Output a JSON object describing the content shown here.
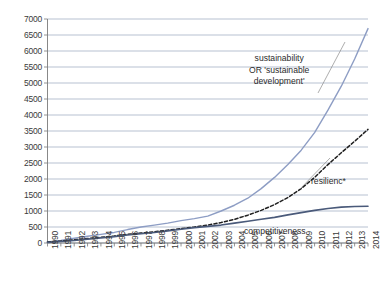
{
  "chart_data": {
    "type": "line",
    "title": "",
    "subtitle": "",
    "xlabel": "",
    "ylabel": "",
    "xlim": [
      1990,
      2014
    ],
    "ylim": [
      0,
      7000
    ],
    "ytick_step": 500,
    "grid": "horizontal",
    "legend": "none (inline annotations)",
    "x": [
      1990,
      1991,
      1992,
      1993,
      1994,
      1995,
      1996,
      1997,
      1998,
      1999,
      2000,
      2001,
      2002,
      2003,
      2004,
      2005,
      2006,
      2007,
      2008,
      2009,
      2010,
      2011,
      2012,
      2013,
      2014
    ],
    "yticks": [
      0,
      500,
      1000,
      1500,
      2000,
      2500,
      3000,
      3500,
      4000,
      4500,
      5000,
      5500,
      6000,
      6500,
      7000
    ],
    "ytick_labels": [
      "0",
      "500",
      "1000",
      "1500",
      "2000",
      "2500",
      "3000",
      "3500",
      "4000",
      "4500",
      "5000",
      "5500",
      "6000",
      "6500",
      "7000"
    ],
    "xtick_labels": [
      "1990",
      "1991",
      "1992",
      "1993",
      "1994",
      "1995",
      "1996",
      "1997",
      "1998",
      "1999",
      "2000",
      "2001",
      "2002",
      "2003",
      "2004",
      "2005",
      "2006",
      "2007",
      "2008",
      "2009",
      "2010",
      "2011",
      "2012",
      "2013",
      "2014"
    ],
    "series": [
      {
        "name": "sustainability OR 'sustainable development'",
        "style": "solid",
        "color": "#8D9DC4",
        "width": 1.4,
        "values": [
          30,
          80,
          150,
          210,
          270,
          330,
          420,
          500,
          560,
          620,
          700,
          760,
          840,
          1000,
          1180,
          1400,
          1700,
          2050,
          2450,
          2900,
          3450,
          4150,
          4900,
          5750,
          6700
        ]
      },
      {
        "name": "resilienc*",
        "style": "dashed",
        "color": "#1f1f1f",
        "width": 1.5,
        "values": [
          30,
          60,
          100,
          140,
          180,
          220,
          270,
          310,
          350,
          400,
          450,
          500,
          560,
          640,
          740,
          870,
          1020,
          1200,
          1420,
          1700,
          2050,
          2450,
          2820,
          3180,
          3550
        ]
      },
      {
        "name": "competitiveness",
        "style": "solid",
        "color": "#4A5A7A",
        "width": 1.6,
        "values": [
          20,
          45,
          80,
          120,
          160,
          200,
          250,
          290,
          330,
          380,
          430,
          480,
          520,
          560,
          620,
          680,
          740,
          800,
          880,
          950,
          1020,
          1080,
          1120,
          1140,
          1150
        ]
      }
    ],
    "annotations": [
      {
        "name": "sustainability-label",
        "lines": [
          "sustainability",
          "OR 'sustainable",
          "development'"
        ],
        "x": 249,
        "y": 53
      },
      {
        "name": "resilience-label",
        "text": "resilienc*",
        "x": 311,
        "y": 176
      },
      {
        "name": "competitiveness-label",
        "text": "competitiveness",
        "x": 244,
        "y": 226
      }
    ]
  },
  "axes": {
    "grid_color": "#9aa7bd",
    "axis_color": "#7a7a7a",
    "tick_color": "#7a7a7a",
    "label_color": "#3a3a3a"
  }
}
